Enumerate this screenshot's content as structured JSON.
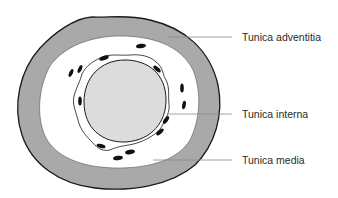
{
  "diagram": {
    "type": "artery-cross-section",
    "colors": {
      "background": "#ffffff",
      "adventitia_fill": "#a9a9a9",
      "media_fill": "#ffffff",
      "lumen_fill": "#dcdcdc",
      "outline": "#1a1a1a",
      "nuclei": "#111111",
      "leader_line": "#8a8a8a",
      "label_text": "#2a2a2a"
    },
    "labels": [
      {
        "id": "adventitia",
        "text": "Tunica adventitia",
        "x": 242,
        "y": 31
      },
      {
        "id": "interna",
        "text": "Tunica interna",
        "x": 242,
        "y": 108
      },
      {
        "id": "media",
        "text": "Tunica media",
        "x": 242,
        "y": 154
      }
    ]
  }
}
